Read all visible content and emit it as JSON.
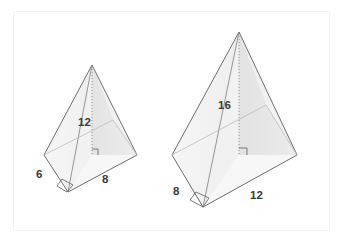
{
  "figure": {
    "background_color": "#ffffff",
    "frame_color": "#f2f2f2",
    "edge_color": "#6e6e6e",
    "label_color": "#3a3a3a",
    "face_light_color": "#f2f2f2",
    "face_mid_color": "#eaeaea",
    "face_dark_color": "#e2e2e2",
    "base_fill_color": "#fbfbfb"
  },
  "shapes": [
    {
      "name": "small-pyramid",
      "labels": {
        "height": "12",
        "base_left_edge": "6",
        "base_right_edge": "8"
      },
      "geometry": {
        "apex": [
          92,
          65
        ],
        "base_left": [
          44,
          155
        ],
        "base_front": [
          68,
          192
        ],
        "base_right": [
          137,
          155
        ],
        "base_back": [
          113,
          120
        ],
        "height_foot": [
          92,
          155
        ]
      },
      "markers": {
        "height_right_angle": true,
        "base_corner_right_angle": true,
        "height_line_style": "dotted"
      }
    },
    {
      "name": "large-pyramid",
      "labels": {
        "height": "16",
        "base_left_edge": "8",
        "base_right_edge": "12"
      },
      "geometry": {
        "apex": [
          239,
          32
        ],
        "base_left": [
          172,
          155
        ],
        "base_front": [
          203,
          207
        ],
        "base_right": [
          297,
          155
        ],
        "base_back": [
          266,
          105
        ],
        "height_foot": [
          239,
          155
        ]
      },
      "markers": {
        "height_right_angle": true,
        "base_corner_right_angle": true,
        "height_line_style": "dotted"
      }
    }
  ],
  "label_positions": {
    "small_height": [
      78,
      126
    ],
    "small_base_left": [
      36,
      178
    ],
    "small_base_right": [
      102,
      183
    ],
    "large_height": [
      218,
      109
    ],
    "large_base_left": [
      173,
      195
    ],
    "large_base_right": [
      250,
      199
    ]
  }
}
